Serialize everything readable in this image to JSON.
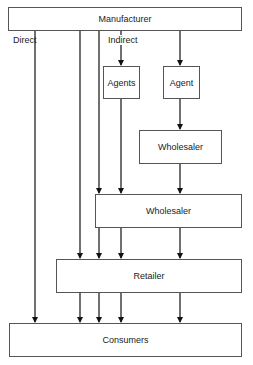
{
  "diagram": {
    "nodes": {
      "manufacturer": "Manufacturer",
      "agents": "Agents",
      "agent": "Agent",
      "wholesaler_upper": "Wholesaler",
      "wholesaler_lower": "Wholesaler",
      "retailer": "Retailer",
      "consumers": "Consumers"
    },
    "labels": {
      "direct": "Direct",
      "indirect": "Indirect"
    },
    "edges": [
      {
        "from": "Manufacturer",
        "to": "Consumers",
        "label": "Direct"
      },
      {
        "from": "Manufacturer",
        "to": "Retailer"
      },
      {
        "from": "Manufacturer",
        "to": "Wholesaler (lower)"
      },
      {
        "from": "Manufacturer",
        "to": "Agents",
        "label": "Indirect"
      },
      {
        "from": "Manufacturer",
        "to": "Agent"
      },
      {
        "from": "Agents",
        "to": "Wholesaler (lower)"
      },
      {
        "from": "Agent",
        "to": "Wholesaler (upper)"
      },
      {
        "from": "Wholesaler (upper)",
        "to": "Wholesaler (lower)"
      },
      {
        "from": "Wholesaler (lower)",
        "to": "Retailer",
        "count": 3
      },
      {
        "from": "Retailer",
        "to": "Consumers",
        "count": 4
      }
    ]
  }
}
